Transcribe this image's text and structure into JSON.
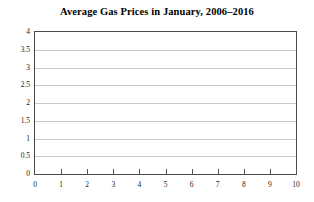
{
  "chart_data": {
    "type": "line",
    "title": "Average Gas Prices in January, 2006–2016",
    "xlabel": "",
    "ylabel": "",
    "xlim": [
      0,
      10
    ],
    "ylim": [
      0,
      4
    ],
    "xticks": [
      0,
      1,
      2,
      3,
      4,
      5,
      6,
      7,
      8,
      9,
      10
    ],
    "xtick_labels": [
      "0",
      "1",
      "2",
      "3",
      "4",
      "5",
      "6",
      "7",
      "8",
      "9",
      "10"
    ],
    "yticks": [
      0,
      0.5,
      1,
      1.5,
      2,
      2.5,
      3,
      3.5,
      4
    ],
    "ytick_labels": [
      "0",
      "0.5",
      "1",
      "1.5",
      "2",
      "2.5",
      "3",
      "3.5",
      "4"
    ],
    "grid": "horizontal",
    "legend": "none",
    "series": [],
    "x": [],
    "values": [],
    "annotations": [],
    "note": "Empty plot frame: axes and gridlines drawn, no data series plotted",
    "colors": {
      "background": "#ffffff",
      "frame": "#4a4a4a",
      "gridline": "#c9c9c9",
      "tick": "#555555",
      "text": "#1a1a1a",
      "title": "#000000"
    }
  }
}
